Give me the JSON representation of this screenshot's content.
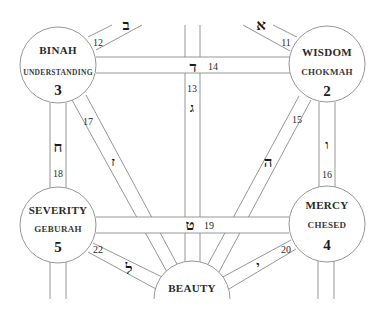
{
  "diagram": {
    "colors": {
      "line": "#8a8a8a",
      "text": "#1a1a1a",
      "background": "#ffffff"
    },
    "sephiroth": [
      {
        "id": "binah",
        "name": "BINAH",
        "sub": "UNDERSTANDING",
        "number": "3",
        "cx": 58,
        "cy": 65,
        "r": 38
      },
      {
        "id": "chokmah",
        "name": "WISDOM",
        "sub": "CHOKMAH",
        "number": "2",
        "cx": 327,
        "cy": 64,
        "r": 38
      },
      {
        "id": "geburah",
        "name": "SEVERITY",
        "sub": "GEBURAH",
        "number": "5",
        "cx": 58,
        "cy": 225,
        "r": 38
      },
      {
        "id": "chesed",
        "name": "MERCY",
        "sub": "CHESED",
        "number": "4",
        "cx": 327,
        "cy": 224,
        "r": 38
      },
      {
        "id": "tiphareth",
        "name": "BEAUTY",
        "sub": "",
        "number": "",
        "cx": 192,
        "cy": 302,
        "r": 38
      }
    ],
    "paths": [
      {
        "number": "11",
        "letter": "א",
        "letter_name": "Aleph"
      },
      {
        "number": "12",
        "letter": "ב",
        "letter_name": "Beth"
      },
      {
        "number": "13",
        "letter": "ג",
        "letter_name": "Gimel"
      },
      {
        "number": "14",
        "letter": "ד",
        "letter_name": "Daleth"
      },
      {
        "number": "15",
        "letter": "ה",
        "letter_name": "Heh"
      },
      {
        "number": "16",
        "letter": "ו",
        "letter_name": "Vav"
      },
      {
        "number": "17",
        "letter": "ז",
        "letter_name": "Zayin"
      },
      {
        "number": "18",
        "letter": "ח",
        "letter_name": "Cheth"
      },
      {
        "number": "19",
        "letter": "ט",
        "letter_name": "Teth"
      },
      {
        "number": "20",
        "letter": "י",
        "letter_name": "Yod"
      },
      {
        "number": "22",
        "letter": "ל",
        "letter_name": "Lamed"
      }
    ]
  }
}
